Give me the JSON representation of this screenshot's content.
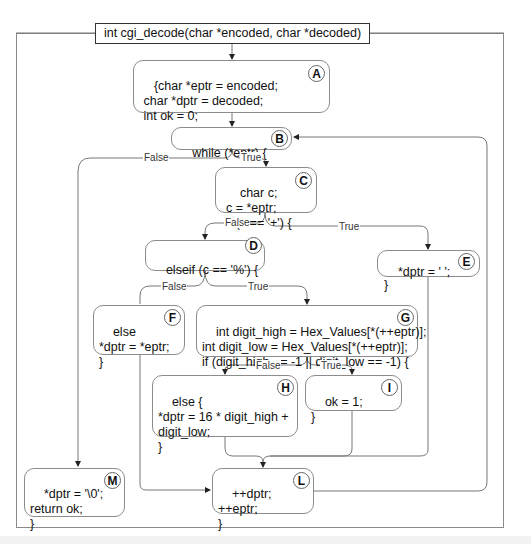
{
  "diagram": {
    "type": "control-flow-graph",
    "function_signature": "int cgi_decode(char *encoded, char *decoded)",
    "nodes": [
      {
        "id": "A",
        "code": "{char *eptr = encoded;\n char *dptr = decoded;\n int ok = 0;"
      },
      {
        "id": "B",
        "code": "while (*eptr) {"
      },
      {
        "id": "C",
        "code": "char c;\nc = *eptr;\nif (c == '+') {"
      },
      {
        "id": "D",
        "code": "elseif (c == '%') {"
      },
      {
        "id": "E",
        "code": "*dptr = ' ';\n}"
      },
      {
        "id": "F",
        "code": "else\n*dptr = *eptr;\n}"
      },
      {
        "id": "G",
        "code": "int digit_high = Hex_Values[*(++eptr)];\nint digit_low = Hex_Values[*(++eptr)];\nif (digit_high == -1 || digit_low == -1) {"
      },
      {
        "id": "H",
        "code": "else {\n*dptr = 16 * digit_high +\ndigit_low;\n}"
      },
      {
        "id": "I",
        "code": "ok = 1;\n}"
      },
      {
        "id": "L",
        "code": "++dptr;\n++eptr;\n}"
      },
      {
        "id": "M",
        "code": "*dptr = '\\0';\nreturn ok;\n}"
      }
    ],
    "edges": [
      {
        "from": "signature",
        "to": "A",
        "label": ""
      },
      {
        "from": "A",
        "to": "B",
        "label": ""
      },
      {
        "from": "B",
        "to": "C",
        "label": "True"
      },
      {
        "from": "B",
        "to": "M",
        "label": "False"
      },
      {
        "from": "C",
        "to": "E",
        "label": "True"
      },
      {
        "from": "C",
        "to": "D",
        "label": "False"
      },
      {
        "from": "D",
        "to": "G",
        "label": "True"
      },
      {
        "from": "D",
        "to": "F",
        "label": "False"
      },
      {
        "from": "G",
        "to": "I",
        "label": "True"
      },
      {
        "from": "G",
        "to": "H",
        "label": "False"
      },
      {
        "from": "E",
        "to": "L",
        "label": ""
      },
      {
        "from": "F",
        "to": "L",
        "label": ""
      },
      {
        "from": "H",
        "to": "L",
        "label": ""
      },
      {
        "from": "I",
        "to": "L",
        "label": ""
      },
      {
        "from": "L",
        "to": "B",
        "label": ""
      }
    ],
    "labels": {
      "true": "True",
      "false": "False"
    }
  }
}
